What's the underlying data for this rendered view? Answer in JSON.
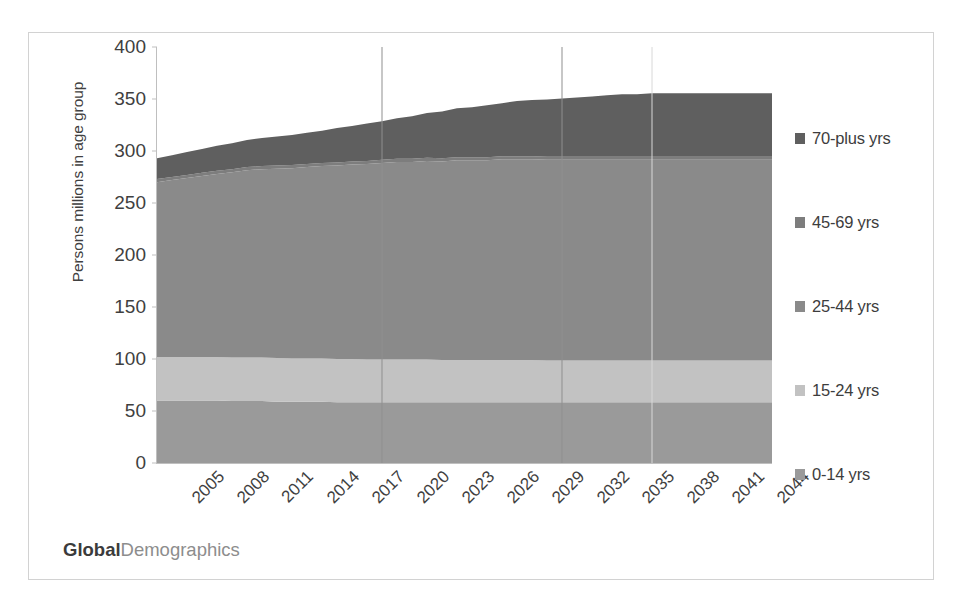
{
  "chart_data": {
    "type": "area",
    "stacked": true,
    "title": "",
    "subtitle": "",
    "xlabel": "",
    "ylabel": "Persons millions in age group",
    "ylim": [
      0,
      400
    ],
    "ytick_step": 50,
    "yticks": [
      0,
      50,
      100,
      150,
      200,
      250,
      300,
      350,
      400
    ],
    "ytick_labels": [
      "0",
      "50",
      "100",
      "150",
      "200",
      "250",
      "300",
      "350",
      "400"
    ],
    "grid": false,
    "vertical_gridlines_at": [
      2020,
      2032,
      2038
    ],
    "legend_position": "right",
    "x": [
      2005,
      2006,
      2007,
      2008,
      2009,
      2010,
      2011,
      2012,
      2013,
      2014,
      2015,
      2016,
      2017,
      2018,
      2019,
      2020,
      2021,
      2022,
      2023,
      2024,
      2025,
      2026,
      2027,
      2028,
      2029,
      2030,
      2031,
      2032,
      2033,
      2034,
      2035,
      2036,
      2037,
      2038,
      2039,
      2040,
      2041,
      2042,
      2043,
      2044,
      2045,
      2046
    ],
    "xtick_labels": [
      "2005",
      "2008",
      "2011",
      "2014",
      "2017",
      "2020",
      "2023",
      "2026",
      "2029",
      "2032",
      "2035",
      "2038",
      "2041",
      "2044"
    ],
    "xtick_values": [
      2005,
      2008,
      2011,
      2014,
      2017,
      2020,
      2023,
      2026,
      2029,
      2032,
      2035,
      2038,
      2041,
      2044
    ],
    "series": [
      {
        "name": "0-14 yrs",
        "color": "#9a9a9a",
        "values": [
          60,
          60,
          60,
          60,
          60,
          59.5,
          59.5,
          59.5,
          59,
          59,
          59,
          59,
          58.5,
          58.5,
          58.5,
          58.5,
          58.5,
          58.5,
          58.5,
          58.5,
          58.5,
          58.5,
          58.5,
          58.5,
          58.5,
          58.5,
          58.5,
          58.5,
          58.5,
          58.5,
          58.5,
          58.5,
          58.5,
          58.5,
          58.5,
          58.5,
          58.5,
          58.5,
          58.5,
          58.5,
          58.5,
          58.5
        ]
      },
      {
        "name": "15-24 yrs",
        "color": "#c2c2c2",
        "values": [
          42,
          42,
          42,
          42,
          42,
          42,
          42,
          42,
          42,
          41.5,
          41.5,
          41.5,
          41.5,
          41.5,
          41,
          41,
          41,
          41,
          41,
          40.5,
          40.5,
          40.5,
          40.5,
          40.5,
          40.5,
          40.5,
          40,
          40,
          40,
          40,
          40,
          40,
          40,
          40,
          40,
          40,
          40,
          40,
          40,
          40,
          40,
          40
        ]
      },
      {
        "name": "25-44 yrs",
        "color": "#8a8a8a",
        "values": [
          168,
          170,
          172,
          174,
          176,
          178,
          180,
          181,
          182,
          183,
          184,
          185,
          186,
          187,
          188,
          189,
          190,
          190,
          191,
          191,
          192,
          192,
          192,
          193,
          193,
          193,
          193,
          193,
          193,
          193,
          193,
          193,
          193,
          193,
          193,
          193,
          193,
          193,
          193,
          193,
          193,
          193
        ]
      },
      {
        "name": "45-69 yrs",
        "color": "#7d7d7d",
        "values": [
          3,
          3,
          3,
          3,
          3,
          3,
          3,
          3,
          3,
          3,
          3,
          3,
          3,
          3,
          3,
          3,
          3,
          3,
          3,
          3,
          3,
          3,
          3,
          3,
          3,
          3,
          3,
          3,
          3,
          3,
          3,
          3,
          3,
          3,
          3,
          3,
          3,
          3,
          3,
          3,
          3,
          3
        ]
      },
      {
        "name": "70-plus yrs",
        "color": "#5f5f5f",
        "values": [
          20,
          21,
          22,
          23,
          24,
          25,
          26,
          27,
          28,
          29,
          30,
          31,
          33,
          34,
          36,
          37,
          39,
          41,
          43,
          45,
          47,
          48,
          50,
          51,
          53,
          54,
          55,
          56,
          57,
          58,
          59,
          60,
          60,
          61,
          61,
          61,
          61,
          61,
          61,
          61,
          61,
          61
        ]
      }
    ],
    "totals": [
      293,
      296,
      299,
      302,
      305,
      307.5,
      310.5,
      312.5,
      314,
      315.5,
      317.5,
      319.5,
      322,
      324,
      326.5,
      328.5,
      331.5,
      333.5,
      336.5,
      338,
      341,
      342,
      344,
      346,
      348,
      349,
      349.5,
      350.5,
      351.5,
      352.5,
      353.5,
      354.5,
      354.5,
      355.5,
      355.5,
      355.5,
      355.5,
      355.5,
      355.5,
      355.5,
      355.5,
      355.5
    ]
  },
  "legend": {
    "items": [
      {
        "label": "70-plus yrs",
        "color": "#5f5f5f"
      },
      {
        "label": "45-69 yrs",
        "color": "#7d7d7d"
      },
      {
        "label": "25-44 yrs",
        "color": "#8a8a8a"
      },
      {
        "label": "15-24 yrs",
        "color": "#c2c2c2"
      },
      {
        "label": "0-14 yrs",
        "color": "#9a9a9a"
      }
    ]
  },
  "watermark": {
    "bold_text": "Global",
    "light_text": "Demographics"
  }
}
